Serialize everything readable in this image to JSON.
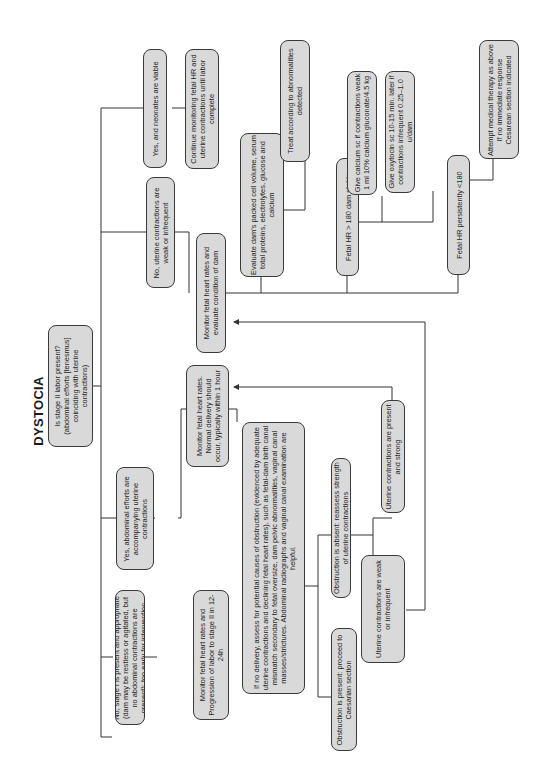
{
  "title": "DYSTOCIA",
  "nodes": {
    "stage2_question": "Is stage II labor present? (abdominal efforts [tenesmus] coinciding with uterine contractions)",
    "no_stage1": "No, stage I is present and appropriate (dam may be restless or agitated, but no abdominal contractions are present): too early for intervention",
    "monitor_stage2": "Monitor fetal heart rates and Progression of labor to stage II in 12-24h",
    "yes_abdominal": "Yes, abdominal efforts are accompanying uterine contractions",
    "monitor_normal": "Monitor fetal heart rates. Normal delivery should occur, typically within 1 hour",
    "no_delivery": "If no delivery, assess for potential causes of obstruction (evidenced by adequate uterine contractions and declining fetal heart rates), such as fetal-dam birth canal mismatch secondary to fetal oversize, dam pelvic abnormalities, vaginal canal masses/strictures. Abdominal radiographs and vaginal canal examination are helpful.",
    "obstruction_present": "Obstruction is present: proceed to Caesarian section",
    "obstruction_absent": "Obstruction is absent: reassess strength of uterine contractions",
    "uterine_weak": "Uterine contractions are weak or infrequent",
    "uterine_strong": "Uterine contractions are present and strong",
    "no_uterine_weak": "No, uterine contractions are weak or infrequent",
    "monitor_evaluate_dam": "Monitor fetal heart rates and evaluate condition of dam",
    "evaluate_bloodwork": "Evaluate dam's packed cell volume, serum total proteins, electrolytes, glucose and calcium",
    "treat_abnormalities": "Treat according to abnormalities detected",
    "fetal_hr_stable": "Fetal HR > 180 dam stable",
    "give_calcium": "Give calcium sc if contractions weak 1 ml 10% calcium gluconate/4.5 kg",
    "give_oxytocin": "Give oxytocin sc 10-15 min. later if contractions infrequent 0.25–1.0 u/dam",
    "fetal_hr_low": "Fetal HR persistently <180",
    "attempt_medical": "Attempt medical therapy as above If no immediate response Cesarean section indicated",
    "yes_viable": "Yes, and neonates are viable",
    "continue_monitoring": "Continue monitoring fetal HR and uterine contractions until labor complete"
  },
  "colors": {
    "node_fill": "#d9d9d9",
    "node_border": "#3a3a3a",
    "line": "#333333",
    "background": "#ffffff"
  }
}
